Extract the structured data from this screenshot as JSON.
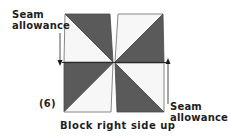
{
  "diagram": {
    "type": "quilt-block-instruction",
    "step_number": "(6)",
    "caption": "Block right side up",
    "annotations": {
      "seam_left": {
        "line1": "Seam",
        "line2": "allowance",
        "arrow_direction": "down"
      },
      "seam_right": {
        "line1": "Seam",
        "line2": "allowance",
        "arrow_direction": "up"
      }
    },
    "block": {
      "layout": "2x2 half-square triangles (pinwheel)",
      "quadrants": [
        {
          "position": "top-left",
          "dark_triangle": "top-right",
          "light_triangle": "bottom-left"
        },
        {
          "position": "top-right",
          "dark_triangle": "bottom-right",
          "light_triangle": "top-left"
        },
        {
          "position": "bottom-left",
          "dark_triangle": "top-left",
          "light_triangle": "bottom-right"
        },
        {
          "position": "bottom-right",
          "dark_triangle": "bottom-left",
          "light_triangle": "top-right"
        }
      ]
    },
    "colors": {
      "dark_fabric": "#5a5a5a",
      "light_fabric": "#f7f7f7",
      "outline": "#4a4a4a",
      "text": "#1f1f1f",
      "arrow": "#3a3a3a"
    }
  }
}
